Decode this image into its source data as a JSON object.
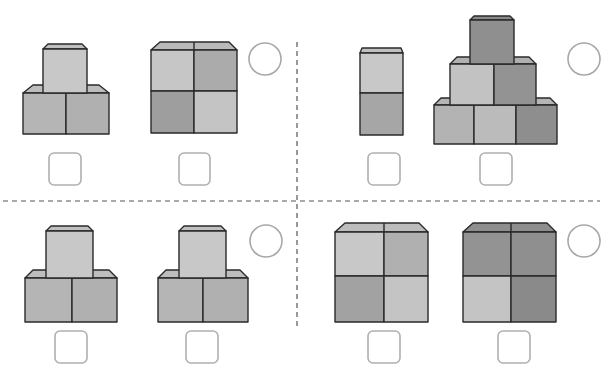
{
  "worksheet": {
    "instructions_visible": false,
    "colors": {
      "light": "#cbcbcb",
      "light2": "#c2c2c2",
      "medium": "#b3b3b3",
      "medium_dark": "#a3a3a3",
      "dark": "#939393",
      "darker": "#858585",
      "top_face_light": "#bdbdbd",
      "top_face_dark": "#8e8e8e",
      "outline": "#2a2a2a",
      "answer_outline": "#b0b0b0",
      "divider": "#555555"
    },
    "panels": [
      {
        "id": "top-left",
        "figures": [
          {
            "name": "stack-2-bottom-1-top",
            "blocks": 3
          },
          {
            "name": "grid-2x2",
            "blocks": 4
          }
        ],
        "answer_boxes": [
          "",
          ""
        ],
        "circle": ""
      },
      {
        "id": "top-right",
        "figures": [
          {
            "name": "column-2",
            "blocks": 2
          },
          {
            "name": "pyramid-3-2-1",
            "blocks": 6
          }
        ],
        "answer_boxes": [
          "",
          ""
        ],
        "circle": ""
      },
      {
        "id": "bottom-left",
        "figures": [
          {
            "name": "stack-2-bottom-1-top",
            "blocks": 3
          },
          {
            "name": "stack-2-bottom-1-top",
            "blocks": 3
          }
        ],
        "answer_boxes": [
          "",
          ""
        ],
        "circle": ""
      },
      {
        "id": "bottom-right",
        "figures": [
          {
            "name": "grid-2x2-light",
            "blocks": 4
          },
          {
            "name": "grid-2x2-dark",
            "blocks": 4
          }
        ],
        "answer_boxes": [
          "",
          ""
        ],
        "circle": ""
      }
    ]
  }
}
